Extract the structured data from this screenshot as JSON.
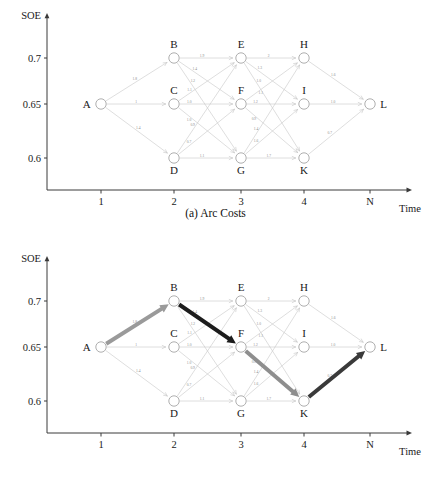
{
  "figure": {
    "panels": [
      {
        "id": "a",
        "caption": "(a) Arc Costs",
        "y_axis_name": "SOE",
        "x_axis_name": "Time",
        "y_ticks": [
          "0.7",
          "0.65",
          "0.6"
        ],
        "x_ticks": [
          "1",
          "2",
          "3",
          "4",
          "N"
        ]
      },
      {
        "id": "b",
        "caption": "(b) Cost-to-go and optimal path",
        "y_axis_name": "SOE",
        "x_axis_name": "Time",
        "y_ticks": [
          "0.7",
          "0.65",
          "0.6"
        ],
        "x_ticks": [
          "1",
          "2",
          "3",
          "4",
          "N"
        ]
      }
    ]
  },
  "chart_data": {
    "type": "diagram",
    "xlabel": "Time",
    "ylabel": "SOE",
    "x_tick_labels": [
      "1",
      "2",
      "3",
      "4",
      "N"
    ],
    "y_tick_labels": [
      "0.7",
      "0.65",
      "0.6"
    ],
    "y_tick_values": [
      0.7,
      0.65,
      0.6
    ],
    "grid": false,
    "legend": "none",
    "nodes": [
      {
        "id": "A",
        "stage": 1,
        "soe": 0.65,
        "label": "A",
        "label_pos": "left"
      },
      {
        "id": "B",
        "stage": 2,
        "soe": 0.7,
        "label": "B",
        "label_pos": "above"
      },
      {
        "id": "C",
        "stage": 2,
        "soe": 0.65,
        "label": "C",
        "label_pos": "above"
      },
      {
        "id": "D",
        "stage": 2,
        "soe": 0.6,
        "label": "D",
        "label_pos": "below"
      },
      {
        "id": "E",
        "stage": 3,
        "soe": 0.7,
        "label": "E",
        "label_pos": "above"
      },
      {
        "id": "F",
        "stage": 3,
        "soe": 0.65,
        "label": "F",
        "label_pos": "above"
      },
      {
        "id": "G",
        "stage": 3,
        "soe": 0.6,
        "label": "G",
        "label_pos": "below"
      },
      {
        "id": "H",
        "stage": 4,
        "soe": 0.7,
        "label": "H",
        "label_pos": "above"
      },
      {
        "id": "I",
        "stage": 4,
        "soe": 0.65,
        "label": "I",
        "label_pos": "above"
      },
      {
        "id": "K",
        "stage": 4,
        "soe": 0.6,
        "label": "K",
        "label_pos": "below"
      },
      {
        "id": "L",
        "stage": 5,
        "soe": 0.65,
        "label": "L",
        "label_pos": "right"
      }
    ],
    "arcs": [
      {
        "from": "A",
        "to": "B",
        "cost": "1.8"
      },
      {
        "from": "A",
        "to": "C",
        "cost": "1"
      },
      {
        "from": "A",
        "to": "D",
        "cost": "1.4"
      },
      {
        "from": "B",
        "to": "E",
        "cost": "1.9"
      },
      {
        "from": "B",
        "to": "F",
        "cost": "1.4"
      },
      {
        "from": "B",
        "to": "G",
        "cost": "1.2"
      },
      {
        "from": "C",
        "to": "E",
        "cost": "1.1"
      },
      {
        "from": "C",
        "to": "F",
        "cost": "1.0"
      },
      {
        "from": "C",
        "to": "G",
        "cost": "1.0"
      },
      {
        "from": "D",
        "to": "E",
        "cost": "0.9"
      },
      {
        "from": "D",
        "to": "F",
        "cost": "0.7"
      },
      {
        "from": "D",
        "to": "G",
        "cost": "1.1"
      },
      {
        "from": "E",
        "to": "H",
        "cost": "2"
      },
      {
        "from": "E",
        "to": "I",
        "cost": "1.3"
      },
      {
        "from": "E",
        "to": "K",
        "cost": "1.0"
      },
      {
        "from": "F",
        "to": "H",
        "cost": "1.1"
      },
      {
        "from": "F",
        "to": "I",
        "cost": "1.2"
      },
      {
        "from": "F",
        "to": "K",
        "cost": "0.9"
      },
      {
        "from": "G",
        "to": "H",
        "cost": "1.4"
      },
      {
        "from": "G",
        "to": "I",
        "cost": "1.6"
      },
      {
        "from": "G",
        "to": "K",
        "cost": "1.7"
      },
      {
        "from": "H",
        "to": "L",
        "cost": "1.6"
      },
      {
        "from": "I",
        "to": "L",
        "cost": "1.0"
      },
      {
        "from": "K",
        "to": "L",
        "cost": "0.7"
      }
    ],
    "optimal_path": {
      "nodes": [
        "A",
        "B",
        "F",
        "K",
        "L"
      ],
      "segments": [
        {
          "from": "A",
          "to": "B",
          "color": "#9a9a9a"
        },
        {
          "from": "B",
          "to": "F",
          "color": "#1c1c1c"
        },
        {
          "from": "F",
          "to": "K",
          "color": "#8e8e8e"
        },
        {
          "from": "K",
          "to": "L",
          "color": "#3a3a3a"
        }
      ]
    },
    "colors": {
      "arc": "#c2c2c2",
      "arc_label": "#8a8a8a",
      "node_stroke": "#9a9a9a",
      "node_fill": "#ffffff",
      "axis": "#3a3a3a",
      "text": "#1a1a1a",
      "path_light": "#9a9a9a",
      "path_dark": "#1c1c1c"
    }
  }
}
